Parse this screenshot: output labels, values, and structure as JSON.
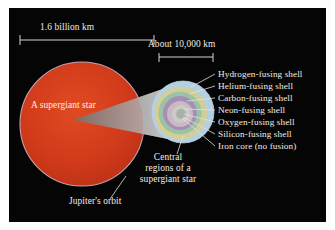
{
  "figure": {
    "background_color": "#050505",
    "frame_color": "#ffffff",
    "text_color": "#f2ece2"
  },
  "scales": [
    {
      "id": "outer-scale",
      "label": "1.6 billion km",
      "x1": 11,
      "x2": 145,
      "y": 32,
      "label_x": 40,
      "label_y": 18
    },
    {
      "id": "inner-scale",
      "label": "About 10,000 km",
      "x1": 150,
      "x2": 204,
      "y": 49,
      "label_x": 143,
      "label_y": 34
    }
  ],
  "star": {
    "label": "A supergiant star",
    "color": "#d6391d",
    "rim_color": "#c4a0a8",
    "cx": 82,
    "cy": 124,
    "r": 62
  },
  "orbit": {
    "label": "Jupiter's orbit"
  },
  "central_region": {
    "label": "Central regions of a supergiant star",
    "lines": [
      "Central",
      "regions of a",
      "supergiant star"
    ]
  },
  "core_layers": [
    {
      "name": "hydrogen-fusing-shell",
      "label": "Hydrogen-fusing shell",
      "color": "#a9c8dd",
      "radius": 31
    },
    {
      "name": "helium-fusing-shell",
      "label": "Helium-fusing shell",
      "color": "#e8c84f",
      "radius": 26
    },
    {
      "name": "carbon-fusing-shell",
      "label": "Carbon-fusing shell",
      "color": "#7fb36b",
      "radius": 21.5
    },
    {
      "name": "neon-fusing-shell",
      "label": "Neon-fusing shell",
      "color": "#8e4f86",
      "radius": 17
    },
    {
      "name": "oxygen-fusing-shell",
      "label": "Oxygen-fusing shell",
      "color": "#e29ca6",
      "radius": 13
    },
    {
      "name": "silicon-fusing-shell",
      "label": "Silicon-fusing shell",
      "color": "#d9c7a6",
      "radius": 9
    },
    {
      "name": "iron-core",
      "label": "Iron core (no fusion)",
      "color": "#9c8e74",
      "radius": 5
    }
  ],
  "callouts": [
    {
      "name": "callout-hydrogen",
      "label": "Hydrogen-fusing shell",
      "text_x": 218,
      "text_y": 69,
      "line": [
        214,
        72,
        193,
        84
      ]
    },
    {
      "name": "callout-helium",
      "label": "Helium-fusing shell",
      "text_x": 218,
      "text_y": 81,
      "line": [
        214,
        84,
        189,
        91
      ]
    },
    {
      "name": "callout-carbon",
      "label": "Carbon-fusing shell",
      "text_x": 218,
      "text_y": 93,
      "line": [
        214,
        96,
        186,
        98
      ]
    },
    {
      "name": "callout-neon",
      "label": "Neon-fusing shell",
      "text_x": 218,
      "text_y": 105,
      "line": [
        214,
        108,
        183,
        107
      ]
    },
    {
      "name": "callout-oxygen",
      "label": "Oxygen-fusing shell",
      "text_x": 218,
      "text_y": 117,
      "line": [
        214,
        119,
        180,
        112
      ]
    },
    {
      "name": "callout-silicon",
      "label": "Silicon-fusing shell",
      "text_x": 218,
      "text_y": 129,
      "line": [
        214,
        131,
        178,
        116
      ]
    },
    {
      "name": "callout-iron",
      "label": "Iron core (no fusion)",
      "text_x": 218,
      "text_y": 141,
      "line": [
        214,
        143,
        176,
        119
      ]
    }
  ]
}
